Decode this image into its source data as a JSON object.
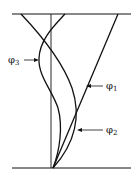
{
  "diagram": {
    "type": "mode-shapes",
    "labels": [
      {
        "id": "phi1",
        "symbol": "φ",
        "subscript": "1"
      },
      {
        "id": "phi2",
        "symbol": "φ",
        "subscript": "2"
      },
      {
        "id": "phi3",
        "symbol": "φ",
        "subscript": "3"
      }
    ],
    "colors": {
      "line": "#111111",
      "background": "#ffffff"
    }
  }
}
